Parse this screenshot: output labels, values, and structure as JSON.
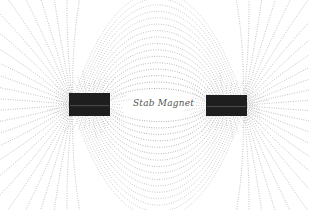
{
  "figure": {
    "caption": "Stab Magnet",
    "caption_pos": {
      "x": 133,
      "y": 98
    },
    "background": "#ffffff",
    "line_color": "#6a6a6a",
    "magnet_color": "#1e1e1e",
    "magnets": [
      {
        "name": "left-magnet",
        "x": 69,
        "y": 93,
        "w": 41,
        "h": 23
      },
      {
        "name": "right-magnet",
        "x": 206,
        "y": 95,
        "w": 41,
        "h": 21
      }
    ],
    "field": {
      "center_gap_half_height": 10,
      "outer_lines": 16,
      "radial_lines_per_pole": 26
    }
  }
}
